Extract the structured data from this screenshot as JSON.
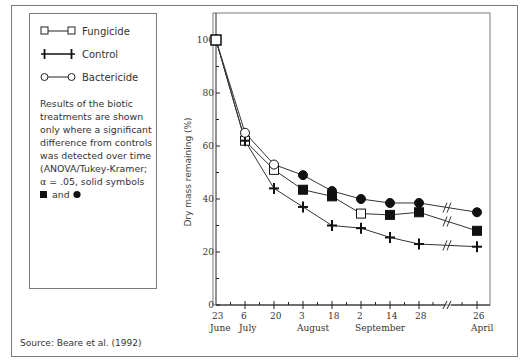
{
  "legend": {
    "items": [
      {
        "label": "Fungicide",
        "symbol": "open-square"
      },
      {
        "label": "Control",
        "symbol": "cross"
      },
      {
        "label": "Bactericide",
        "symbol": "open-circle"
      }
    ],
    "note": "Results of the biotic treatments are shown only where a significant difference from controls was detected over time (ANOVA/Tukey-Kramer; α = .05, solid symbols",
    "note_end": "and"
  },
  "source": "Source: Beare et al. (1992)",
  "chart_data": {
    "type": "line",
    "title": "",
    "xlabel": "",
    "ylabel": "Dry mass remaining (%)",
    "ylim": [
      0,
      110
    ],
    "yticks": [
      0,
      20,
      40,
      60,
      80,
      100
    ],
    "x_categories": [
      {
        "day": "23",
        "month": "June"
      },
      {
        "day": "6",
        "month": "July"
      },
      {
        "day": "20",
        "month": ""
      },
      {
        "day": "3",
        "month": "August"
      },
      {
        "day": "18",
        "month": ""
      },
      {
        "day": "2",
        "month": "September"
      },
      {
        "day": "14",
        "month": ""
      },
      {
        "day": "28",
        "month": ""
      },
      {
        "day": "26",
        "month": "April"
      }
    ],
    "axis_break_after_index": 7,
    "series": [
      {
        "name": "Fungicide",
        "marker": "square",
        "values": [
          100,
          62,
          51,
          43.5,
          41,
          34.5,
          34,
          35,
          28
        ],
        "significant": [
          false,
          false,
          false,
          true,
          true,
          false,
          true,
          true,
          true
        ]
      },
      {
        "name": "Control",
        "marker": "cross",
        "values": [
          100,
          62,
          44,
          37,
          30,
          29,
          25.5,
          23,
          22
        ],
        "significant": [
          false,
          false,
          false,
          false,
          false,
          false,
          false,
          false,
          false
        ]
      },
      {
        "name": "Bactericide",
        "marker": "circle",
        "values": [
          100,
          65,
          53,
          49,
          43,
          40,
          38.5,
          38.5,
          35
        ],
        "significant": [
          false,
          false,
          false,
          true,
          true,
          true,
          true,
          true,
          true
        ]
      }
    ],
    "grid": false,
    "legend_position": "left"
  }
}
